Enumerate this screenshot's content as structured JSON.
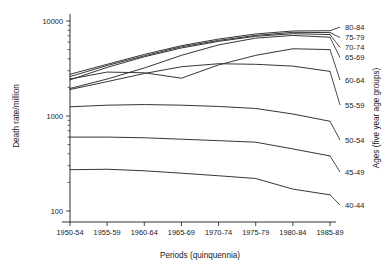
{
  "chart_data": {
    "type": "line",
    "title": "",
    "xlabel": "Periods (quinquennia)",
    "ylabel": "Death rate/million",
    "legend_title": "Ages (five year age groups)",
    "legend_position": "right",
    "grid": false,
    "yscale": "log",
    "ylim": [
      100,
      10000
    ],
    "ytick_labels": [
      "10000",
      "1000",
      "100"
    ],
    "ytick_values": [
      10000,
      1000,
      100
    ],
    "categories": [
      "1950-54",
      "1955-59",
      "1960-64",
      "1965-69",
      "1970-74",
      "1975-79",
      "1980-84",
      "1985-89"
    ],
    "series": [
      {
        "name": "80-84",
        "label": "80-84",
        "values": [
          2750,
          3500,
          4450,
          5500,
          6450,
          7300,
          7850,
          7900
        ]
      },
      {
        "name": "75-79",
        "label": "75-79",
        "values": [
          2600,
          3400,
          4300,
          5350,
          6250,
          7050,
          7600,
          7550
        ]
      },
      {
        "name": "70-74",
        "label": "70-74",
        "values": [
          2400,
          3250,
          4200,
          5200,
          6100,
          6900,
          7350,
          7200
        ]
      },
      {
        "name": "65-69",
        "label": "65-69",
        "values": [
          1950,
          2450,
          3200,
          4350,
          5600,
          6600,
          7050,
          6750
        ]
      },
      {
        "name": "60-64",
        "label": "60-64",
        "values": [
          2450,
          2900,
          2850,
          2500,
          3450,
          4350,
          5100,
          5000
        ]
      },
      {
        "name": "55-59",
        "label": "55-59",
        "values": [
          1900,
          2300,
          2800,
          3300,
          3550,
          3500,
          3350,
          2950
        ]
      },
      {
        "name": "50-54",
        "label": "50-54",
        "values": [
          1250,
          1300,
          1320,
          1300,
          1260,
          1200,
          1050,
          880
        ]
      },
      {
        "name": "45-49",
        "label": "45-49",
        "values": [
          600,
          600,
          590,
          570,
          550,
          530,
          450,
          380
        ]
      },
      {
        "name": "40-44",
        "label": "40-44",
        "values": [
          272,
          275,
          265,
          250,
          235,
          220,
          170,
          148
        ]
      }
    ]
  },
  "colors": {
    "line": "#2b2b2b",
    "axis": "#1a1a1a",
    "background": "#ffffff"
  }
}
